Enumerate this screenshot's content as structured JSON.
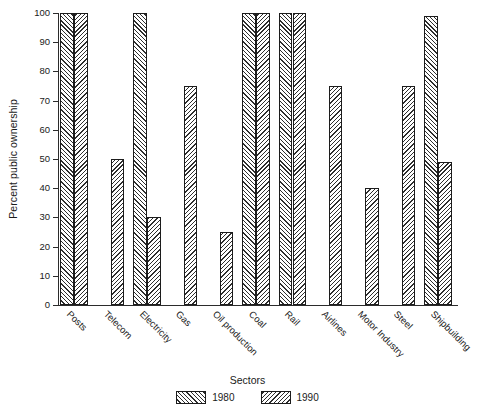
{
  "chart_data": {
    "type": "bar",
    "title": "",
    "xlabel": "Sectors",
    "ylabel": "Percent public ownership",
    "ylim": [
      0,
      100
    ],
    "ytick_step": 10,
    "yticks": [
      0,
      10,
      20,
      30,
      40,
      50,
      60,
      70,
      80,
      90,
      100
    ],
    "ytick_labels": [
      "0",
      "10",
      "20",
      "30",
      "40",
      "50",
      "60",
      "70",
      "80",
      "90",
      "100"
    ],
    "grid": false,
    "legend_position": "bottom-center",
    "legend_title": "Sectors",
    "categories": [
      "Posts",
      "Telecom",
      "Electricity",
      "Gas",
      "Oil production",
      "Coal",
      "Rail",
      "Airlines",
      "Motor Industry",
      "Steel",
      "Shipbuilding"
    ],
    "series": [
      {
        "name": "1980",
        "hatch": "forward-diagonal",
        "values": [
          100,
          0,
          100,
          0,
          0,
          100,
          100,
          0,
          0,
          0,
          99
        ]
      },
      {
        "name": "1990",
        "hatch": "backward-diagonal",
        "values": [
          100,
          50,
          30,
          75,
          25,
          100,
          100,
          75,
          40,
          75,
          49
        ]
      }
    ]
  }
}
